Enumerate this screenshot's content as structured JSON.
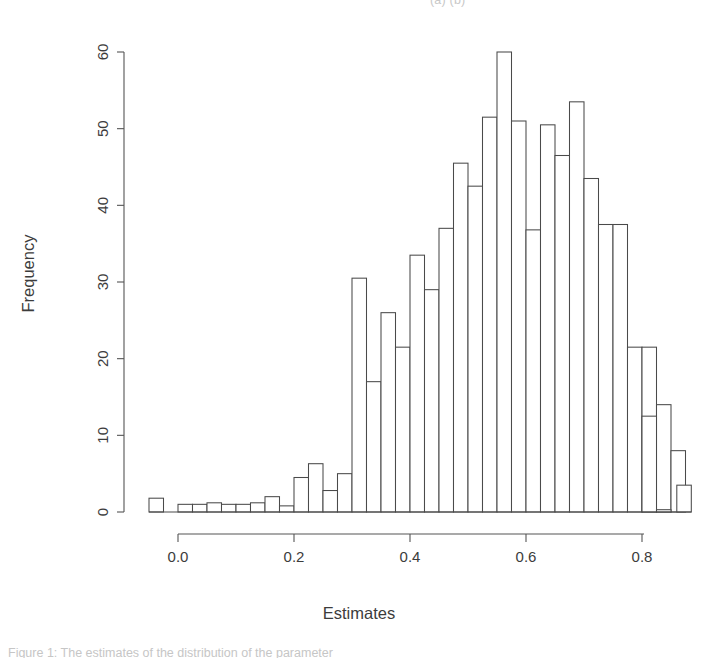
{
  "page": {
    "top_cropped_text": "(a)                    (b)",
    "bottom_cropped_text": "Figure  1:  The  estimates  of  the  distribution  of  the  parameter"
  },
  "chart_data": {
    "type": "bar",
    "subtype": "histogram",
    "title": "",
    "xlabel": "Estimates",
    "ylabel": "Frequency",
    "xlim": [
      -0.06,
      0.9
    ],
    "ylim": [
      0,
      60
    ],
    "xticks": [
      "0.0",
      "0.2",
      "0.4",
      "0.6",
      "0.8"
    ],
    "xtick_values": [
      0.0,
      0.2,
      0.4,
      0.6,
      0.8
    ],
    "yticks": [
      "0",
      "10",
      "20",
      "30",
      "40",
      "50",
      "60"
    ],
    "ytick_values": [
      0,
      10,
      20,
      30,
      40,
      50,
      60
    ],
    "grid": false,
    "legend": "none",
    "bin_width": 0.025,
    "bin_starts": [
      -0.05,
      -0.025,
      0.0,
      0.025,
      0.05,
      0.075,
      0.1,
      0.125,
      0.15,
      0.175,
      0.2,
      0.225,
      0.25,
      0.275,
      0.3,
      0.325,
      0.35,
      0.375,
      0.4,
      0.425,
      0.45,
      0.475,
      0.5,
      0.525,
      0.55,
      0.575,
      0.6,
      0.625,
      0.65,
      0.675,
      0.7,
      0.725,
      0.75,
      0.775,
      0.8,
      0.825,
      0.85
    ],
    "values": [
      1.8,
      0,
      1,
      1,
      1.2,
      1,
      1,
      1.2,
      2,
      0.8,
      4.5,
      6.3,
      2.8,
      5,
      30.5,
      17,
      26,
      21.5,
      33.5,
      29,
      37,
      45.5,
      42.5,
      51.5,
      60,
      51,
      36.8,
      50.5,
      46.5,
      53.5,
      43.5,
      37.5,
      37.5,
      21.5,
      21.5,
      14,
      8
    ],
    "tail_bins": [
      {
        "start": 0.8,
        "value": 12.5
      },
      {
        "start": 0.825,
        "value": 0.3
      },
      {
        "start": 0.86,
        "value": 3.5
      }
    ]
  },
  "axes": {
    "x_axis_name": "x-axis",
    "y_axis_name": "y-axis"
  }
}
